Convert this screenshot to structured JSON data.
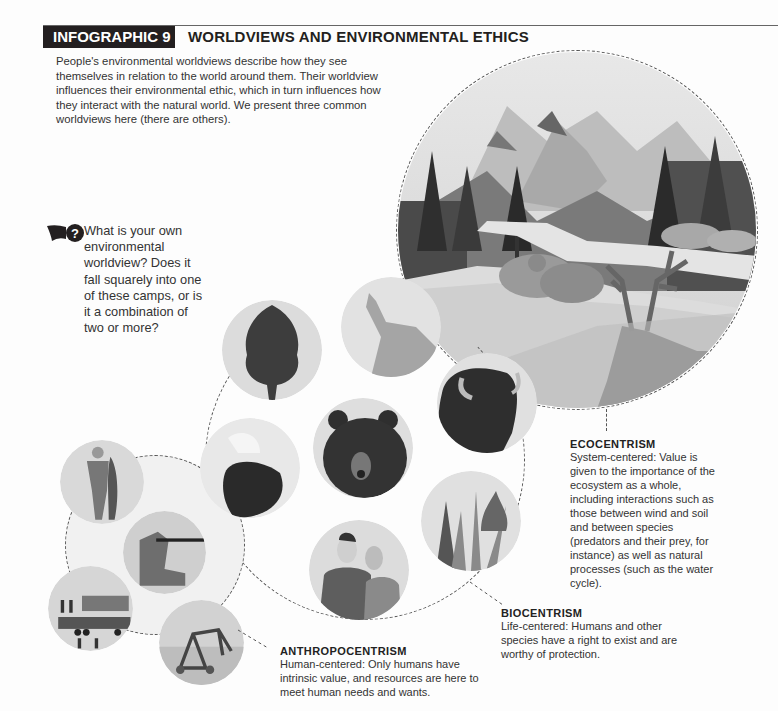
{
  "header": {
    "label": "INFOGRAPHIC 9",
    "title": "WORLDVIEWS AND ENVIRONMENTAL ETHICS"
  },
  "intro": "People's environmental worldviews describe how they see themselves in relation to the world around them. Their worldview influences their environmental ethic, which in turn influences how they interact with the natural world. We present three common worldviews here (there are others).",
  "question": {
    "icon": "question-bubble-icon",
    "text": "What is your own environmental worldview? Does it fall squarely into one of these camps, or is it a combination of two or more?"
  },
  "worldviews": [
    {
      "name": "ECOCENTRISM",
      "description": "System-centered: Value is given to the importance of the ecosystem as a whole, including interactions such as those between wind and soil and between species (predators and their prey, for instance) as well as natural processes (such as the water cycle).",
      "image": "landscape-with-bears-bison-elk"
    },
    {
      "name": "BIOCENTRISM",
      "description": "Life-centered: Humans and other species have a right to exist and are worthy of protection.",
      "images": [
        "tree",
        "howling-wolf",
        "bison",
        "grizzly-bear",
        "bald-eagle",
        "plants",
        "couple"
      ]
    },
    {
      "name": "ANTHROPOCENTRISM",
      "description": "Human-centered: Only humans have intrinsic value, and resources are here to meet human needs and wants.",
      "images": [
        "fisherman-with-fish",
        "hunter-with-rifle",
        "logging-truck",
        "irrigation-sprinkler"
      ]
    }
  ]
}
